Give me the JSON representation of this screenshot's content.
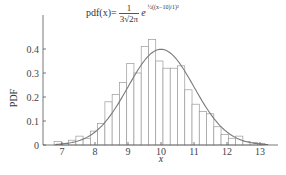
{
  "formula": {
    "lhs": "pdf(x)=",
    "frac_num": "1",
    "frac_den": "3√2π",
    "base": "e",
    "exponent": "½((x−10)/1)²"
  },
  "colors": {
    "bar_stroke": "#9a9a9a",
    "bar_fill": "#ffffff",
    "curve": "#7a7a7a",
    "axis": "#555555"
  },
  "chart_data": {
    "type": "bar",
    "xlabel": "x",
    "ylabel": "PDF",
    "xlim": [
      6.6,
      13.6
    ],
    "ylim": [
      0,
      0.48
    ],
    "xticks": [
      7,
      8,
      9,
      10,
      11,
      12,
      13
    ],
    "yticks": [
      0,
      0.1,
      0.2,
      0.3,
      0.4
    ],
    "ytick_labels": [
      "0",
      "0.1",
      "0.2",
      "0.3",
      "0.4"
    ],
    "grid": false,
    "legend": null,
    "bin_width": 0.22,
    "bin_start": 6.76,
    "values": [
      0.014,
      0.007,
      0.02,
      0.037,
      0.028,
      0.058,
      0.09,
      0.18,
      0.21,
      0.26,
      0.34,
      0.3,
      0.41,
      0.44,
      0.35,
      0.32,
      0.32,
      0.33,
      0.23,
      0.17,
      0.14,
      0.13,
      0.076,
      0.044,
      0.028,
      0.037,
      0.014,
      0.01,
      0.007
    ],
    "overlay_curve": {
      "type": "line",
      "name": "normal pdf",
      "mean": 10,
      "sd": 1,
      "peak": 0.399
    }
  }
}
